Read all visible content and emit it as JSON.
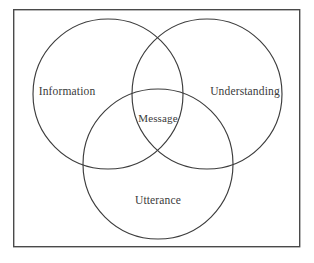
{
  "diagram": {
    "type": "venn-3-set",
    "background_color": "#ffffff",
    "stroke_color": "#3c3c3c",
    "frame_color": "#4a4a4a",
    "text_color": "#3a3a3a",
    "frame": {
      "x": 13,
      "y": 9,
      "width": 287,
      "height": 238
    },
    "circles": [
      {
        "id": "information",
        "label": "Information",
        "cx": 108,
        "cy": 94,
        "r": 75,
        "label_x": 67,
        "label_y": 92
      },
      {
        "id": "understanding",
        "label": "Understanding",
        "cx": 207,
        "cy": 94,
        "r": 75,
        "label_x": 245,
        "label_y": 92
      },
      {
        "id": "utterance",
        "label": "Utterance",
        "cx": 158,
        "cy": 164,
        "r": 75,
        "label_x": 158,
        "label_y": 201
      }
    ],
    "intersection": {
      "id": "message",
      "label": "Message",
      "label_x": 158,
      "label_y": 119
    }
  }
}
